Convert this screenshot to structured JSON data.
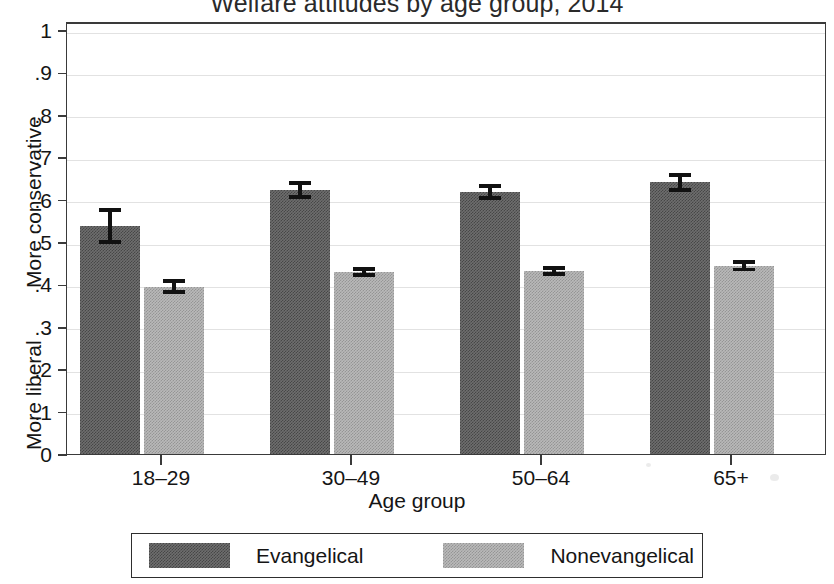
{
  "chart_data": {
    "type": "bar",
    "title": "Welfare attitudes by age group, 2014",
    "xlabel": "Age group",
    "ylabel_top": "More conservative",
    "ylabel_bottom": "More liberal",
    "categories": [
      "18–29",
      "30–49",
      "50–64",
      "65+"
    ],
    "ylim": [
      0,
      1
    ],
    "yticks": [
      0,
      0.1,
      0.2,
      0.3,
      0.4,
      0.5,
      0.6,
      0.7,
      0.8,
      0.9,
      1
    ],
    "ytick_labels": [
      "0",
      ".1",
      ".2",
      ".3",
      ".4",
      ".5",
      ".6",
      ".7",
      ".8",
      ".9",
      "1"
    ],
    "grid": true,
    "legend_position": "bottom",
    "error_bars": "95% confidence interval",
    "series": [
      {
        "name": "Evangelical",
        "color": "#6e6e6e",
        "values": [
          0.545,
          0.63,
          0.625,
          0.648
        ],
        "err_low": [
          0.503,
          0.609,
          0.607,
          0.626
        ],
        "err_high": [
          0.587,
          0.651,
          0.643,
          0.67
        ]
      },
      {
        "name": "Nonevangelical",
        "color": "#b9b9b9",
        "values": [
          0.402,
          0.436,
          0.439,
          0.451
        ],
        "err_low": [
          0.385,
          0.425,
          0.428,
          0.438
        ],
        "err_high": [
          0.419,
          0.447,
          0.45,
          0.464
        ]
      }
    ]
  },
  "legend": {
    "items": [
      {
        "label": "Evangelical",
        "color": "#6e6e6e"
      },
      {
        "label": "Nonevangelical",
        "color": "#b9b9b9"
      }
    ]
  }
}
